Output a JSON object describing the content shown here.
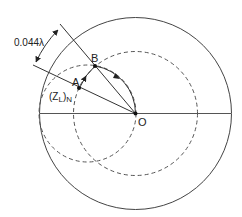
{
  "diagram": {
    "type": "smith-chart-construction",
    "labels": {
      "distance": "0.044λ",
      "point_a": "A",
      "point_b": "B",
      "center": "O",
      "load_impedance": "(Z",
      "load_impedance_sub": "L",
      "load_impedance_close": ")",
      "load_impedance_norm": "N"
    },
    "colors": {
      "line": "#333333",
      "dashed": "#555555",
      "background": "#ffffff"
    }
  }
}
